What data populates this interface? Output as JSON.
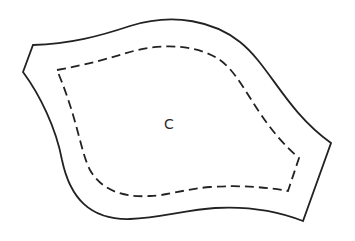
{
  "diagram": {
    "type": "sewing-pattern-piece",
    "piece_label": "C",
    "lines": {
      "outer": {
        "style": "solid",
        "meaning": "cutting-line",
        "color": "#222222"
      },
      "inner": {
        "style": "dashed",
        "meaning": "seam-line",
        "color": "#222222"
      }
    }
  }
}
